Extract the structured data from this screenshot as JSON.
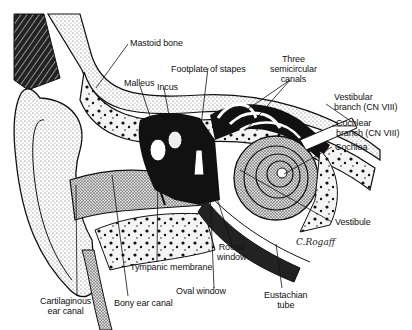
{
  "diagram": {
    "labels": {
      "mastoid_bone": "Mastoid bone",
      "malleus": "Malleus",
      "incus": "Incus",
      "footplate_of_stapes": "Footplate of stapes",
      "three_semicircular_canals": "Three\nsemicircular\ncanals",
      "vestibular_branch": "Vestibular\nbranch (CN VIII)",
      "cochlear_branch": "Cochlear\nbranch (CN VIII)",
      "cochlea": "Cochlea",
      "vestibule": "Vestibule",
      "round_window": "Round\nwindow",
      "oval_window": "Oval window",
      "eustachian_tube": "Eustachian\ntube",
      "tympanic_membrane": "Tympanic membrane",
      "bony_ear_canal": "Bony ear canal",
      "cartilaginous_ear_canal": "Cartilaginous\near canal"
    },
    "signature": "C.Rogaff"
  }
}
